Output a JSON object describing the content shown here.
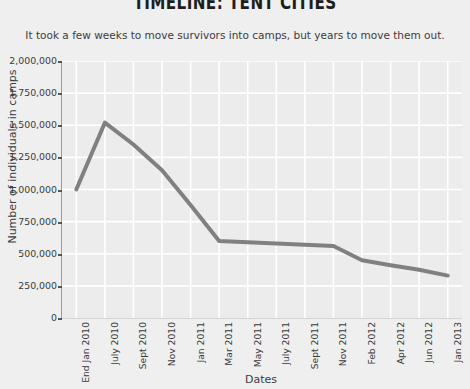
{
  "title": "TIMELINE: TENT CITIES",
  "subtitle": "It took a few weeks to move survivors into camps, but years to move them out.",
  "colors": {
    "page_background": "#efefef",
    "plot_background": "#ececec",
    "gridline": "#ffffff",
    "line": "#808080",
    "text": "#3c3c3c",
    "title_text": "#1d1d1d"
  },
  "chart_data": {
    "type": "line",
    "title": "TIMELINE: TENT CITIES",
    "subtitle": "It took a few weeks to move survivors into camps, but years to move them out.",
    "xlabel": "Dates",
    "ylabel": "Number of individuals in camps",
    "categories": [
      "End Jan 2010",
      "July 2010",
      "Sept 2010",
      "Nov 2010",
      "Jan 2011",
      "Mar 2011",
      "May 2011",
      "July 2011",
      "Sept 2011",
      "Nov 2011",
      "Feb 2012",
      "Apr 2012",
      "Jun 2012",
      "Jan 2013"
    ],
    "values": [
      1000000,
      1520000,
      1350000,
      1150000,
      880000,
      600000,
      590000,
      580000,
      570000,
      560000,
      450000,
      410000,
      375000,
      330000
    ],
    "ylim": [
      0,
      2000000
    ],
    "yticks": [
      0,
      250000,
      500000,
      750000,
      1000000,
      1250000,
      1500000,
      1750000,
      2000000
    ],
    "ytick_labels": [
      "0",
      "250,000",
      "500,000",
      "750,000",
      "1,000,000",
      "1,250,000",
      "1,500,000",
      "1,750,000",
      "2,000,000"
    ],
    "grid": true,
    "legend": null,
    "series_name": "Individuals in camps"
  }
}
